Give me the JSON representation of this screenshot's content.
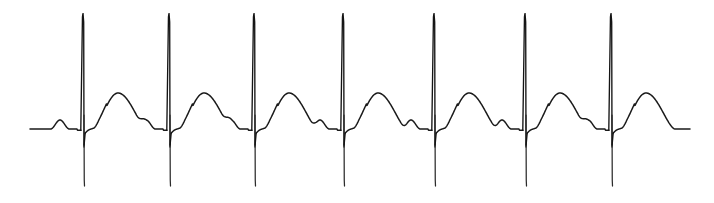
{
  "figure": {
    "kind": "ecg-rhythm-strip",
    "width": 714,
    "height": 203,
    "background_color": "#ffffff",
    "trace_color": "#1a1a1a",
    "trace_width_px": 1.5,
    "title": "",
    "caption": "",
    "axis_labels_visible": false,
    "gridlines_visible": false,
    "legend_visible": false
  },
  "chart_data": {
    "type": "line",
    "title": "",
    "subtitle": "",
    "xlabel": "",
    "ylabel": "",
    "grid": false,
    "legend": false,
    "xlim": [
      0,
      714
    ],
    "ylim": [
      203,
      0
    ],
    "axis_note": "Pixel coordinates of the scanned strip; y increases downward.",
    "baseline_y": 129,
    "trace_start_x": 30,
    "trace_end_x": 690,
    "beat_count": 7,
    "r_peak_x": [
      83,
      169,
      254,
      343,
      434,
      525,
      611
    ],
    "rr_interval_px": [
      86,
      85,
      89,
      91,
      91,
      86
    ],
    "mean_rr_interval_px": 88,
    "r_peak_top_y": 13,
    "s_nadir_y": 180,
    "t_wave_peak_y": 93,
    "t_wave_offset_from_r_px": 35,
    "p_wave_peak_y": 120,
    "p_wave_offset_from_r_px": -23,
    "series": [
      {
        "name": "ECG lead trace",
        "color": "#1a1a1a",
        "features": [
          {
            "wave": "P",
            "x": 57,
            "peak_y": 120,
            "half_width_px": 9
          },
          {
            "wave": "R",
            "x": 83,
            "peak_y": 13,
            "nadir_y": 180
          },
          {
            "wave": "T",
            "x": 118,
            "peak_y": 93,
            "half_width_px": 20
          },
          {
            "wave": "P",
            "x": 146,
            "peak_y": 120,
            "half_width_px": 9
          },
          {
            "wave": "R",
            "x": 169,
            "peak_y": 13,
            "nadir_y": 180
          },
          {
            "wave": "T",
            "x": 204,
            "peak_y": 93,
            "half_width_px": 20
          },
          {
            "wave": "P",
            "x": 231,
            "peak_y": 120,
            "half_width_px": 9
          },
          {
            "wave": "R",
            "x": 254,
            "peak_y": 13,
            "nadir_y": 180
          },
          {
            "wave": "T",
            "x": 289,
            "peak_y": 93,
            "half_width_px": 20
          },
          {
            "wave": "P",
            "x": 320,
            "peak_y": 120,
            "half_width_px": 9
          },
          {
            "wave": "R",
            "x": 343,
            "peak_y": 13,
            "nadir_y": 180
          },
          {
            "wave": "T",
            "x": 378,
            "peak_y": 93,
            "half_width_px": 20
          },
          {
            "wave": "P",
            "x": 411,
            "peak_y": 120,
            "half_width_px": 9
          },
          {
            "wave": "R",
            "x": 434,
            "peak_y": 13,
            "nadir_y": 180
          },
          {
            "wave": "T",
            "x": 469,
            "peak_y": 93,
            "half_width_px": 20
          },
          {
            "wave": "P",
            "x": 502,
            "peak_y": 120,
            "half_width_px": 9
          },
          {
            "wave": "R",
            "x": 525,
            "peak_y": 13,
            "nadir_y": 180
          },
          {
            "wave": "T",
            "x": 560,
            "peak_y": 93,
            "half_width_px": 20
          },
          {
            "wave": "P",
            "x": 588,
            "peak_y": 120,
            "half_width_px": 9
          },
          {
            "wave": "R",
            "x": 611,
            "peak_y": 13,
            "nadir_y": 180
          },
          {
            "wave": "T",
            "x": 646,
            "peak_y": 92,
            "half_width_px": 20
          },
          {
            "wave": "P",
            "x": 672,
            "peak_y": 120,
            "half_width_px": 9
          }
        ]
      }
    ]
  }
}
